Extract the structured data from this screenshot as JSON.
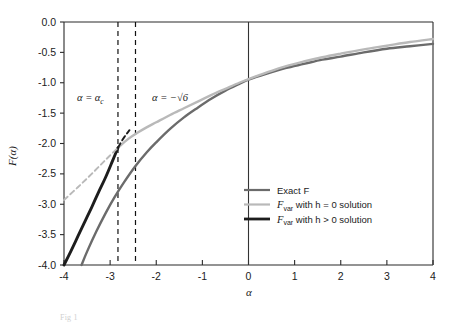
{
  "chart_data": {
    "type": "line",
    "title": "",
    "xlabel": "α",
    "ylabel": "F(α)",
    "xlim": [
      -4,
      4
    ],
    "ylim": [
      -4.0,
      0.0
    ],
    "grid": false,
    "xticks": [
      -4,
      -3,
      -2,
      -1,
      0,
      1,
      2,
      3,
      4
    ],
    "xticklabels": [
      "-4",
      "-3",
      "-2",
      "-1",
      "0",
      "1",
      "2",
      "3",
      "4"
    ],
    "yticks": [
      0.0,
      -0.5,
      -1.0,
      -1.5,
      -2.0,
      -2.5,
      -3.0,
      -3.5,
      -4.0
    ],
    "yticklabels": [
      "0.0",
      "-0.5",
      "-1.0",
      "-1.5",
      "-2.0",
      "-2.5",
      "-3.0",
      "-3.5",
      "-4.0"
    ],
    "legend_position": "lower right",
    "series": [
      {
        "name": "Exact F",
        "color": "#6b6b6b",
        "style": "solid",
        "x": [
          -3.62,
          -3.5,
          -3.3,
          -3.1,
          -2.9,
          -2.7,
          -2.45,
          -2.2,
          -2.0,
          -1.7,
          -1.4,
          -1.1,
          -0.8,
          -0.5,
          -0.2,
          0.0,
          0.4,
          0.8,
          1.2,
          1.6,
          2.0,
          2.5,
          3.0,
          3.5,
          4.0
        ],
        "y": [
          -4.0,
          -3.78,
          -3.45,
          -3.15,
          -2.88,
          -2.64,
          -2.37,
          -2.14,
          -1.98,
          -1.76,
          -1.57,
          -1.41,
          -1.26,
          -1.13,
          -1.02,
          -0.95,
          -0.85,
          -0.76,
          -0.69,
          -0.62,
          -0.57,
          -0.5,
          -0.44,
          -0.4,
          -0.36
        ]
      },
      {
        "name": "F_var with h = 0 solution",
        "color": "#b9b9b9",
        "style": "solid",
        "x": [
          -2.83,
          -2.6,
          -2.4,
          -2.2,
          -2.0,
          -1.7,
          -1.4,
          -1.1,
          -0.8,
          -0.5,
          -0.2,
          0.0,
          0.4,
          0.8,
          1.2,
          1.6,
          2.0,
          2.5,
          3.0,
          3.5,
          4.0
        ],
        "y": [
          -2.07,
          -1.92,
          -1.82,
          -1.73,
          -1.65,
          -1.53,
          -1.42,
          -1.31,
          -1.2,
          -1.1,
          -1.0,
          -0.94,
          -0.83,
          -0.73,
          -0.65,
          -0.58,
          -0.52,
          -0.45,
          -0.39,
          -0.33,
          -0.28
        ]
      },
      {
        "name": "F_var with h > 0 solution",
        "color": "#1d1d1d",
        "style": "solid",
        "x": [
          -4.0,
          -3.85,
          -3.7,
          -3.55,
          -3.4,
          -3.25,
          -3.1,
          -2.95,
          -2.83
        ],
        "y": [
          -4.0,
          -3.77,
          -3.53,
          -3.29,
          -3.05,
          -2.8,
          -2.56,
          -2.29,
          -2.07
        ]
      },
      {
        "name": "F_var h>0 continuation (dashed)",
        "color": "#1d1d1d",
        "style": "dashed",
        "x": [
          -2.83,
          -2.74,
          -2.66,
          -2.58
        ],
        "y": [
          -2.07,
          -1.95,
          -1.86,
          -1.78
        ]
      },
      {
        "name": "F_var h=0 continuation (dashed)",
        "color": "#b9b9b9",
        "style": "dashed",
        "x": [
          -4.0,
          -3.7,
          -3.4,
          -3.1,
          -2.83
        ],
        "y": [
          -2.93,
          -2.72,
          -2.5,
          -2.27,
          -2.07
        ]
      }
    ],
    "annotations": [
      {
        "text": "α = α",
        "sub": "c",
        "x": -3.2,
        "y": -1.0,
        "name": "alpha-c-label"
      },
      {
        "text": "α = −√6",
        "x": -1.95,
        "y": -1.0,
        "name": "alpha-sqrt6-label"
      }
    ],
    "vlines": [
      {
        "x": -2.83,
        "label": "alpha_c",
        "style": "dashed",
        "color": "#111111"
      },
      {
        "x": -2.45,
        "label": "-sqrt(6)",
        "style": "dashed",
        "color": "#111111"
      },
      {
        "x": 0.0,
        "label": "zero",
        "style": "solid",
        "color": "#333333"
      }
    ]
  },
  "legend": {
    "entries": [
      {
        "label": "Exact F",
        "color": "#6b6b6b",
        "weight": 2.2
      },
      {
        "label_prefix": "F",
        "label_sub": "var",
        "label_rest": " with h = 0 solution",
        "color": "#b9b9b9",
        "weight": 2.2
      },
      {
        "label_prefix": "F",
        "label_sub": "var",
        "label_rest": " with h > 0 solution",
        "color": "#1d1d1d",
        "weight": 2.8
      }
    ]
  },
  "axes": {
    "ylabel": "F(α)",
    "xlabel": "α"
  },
  "caption": {
    "text": "Fig 1"
  }
}
